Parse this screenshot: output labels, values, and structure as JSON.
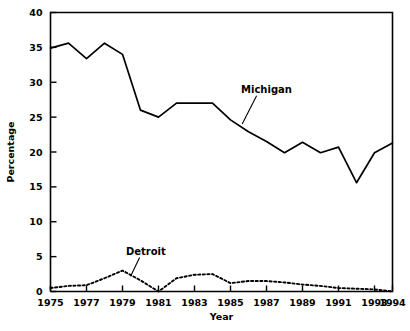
{
  "chart_data": {
    "type": "line",
    "title": "",
    "xlabel": "Year",
    "ylabel": "Percentage",
    "xlim": [
      1975,
      1994
    ],
    "ylim": [
      0,
      40
    ],
    "ytick_labels": [
      "0",
      "5",
      "10",
      "15",
      "20",
      "25",
      "30",
      "35",
      "40"
    ],
    "yticks": [
      0,
      5,
      10,
      15,
      20,
      25,
      30,
      35,
      40
    ],
    "xtick_labels": [
      "1975",
      "1977",
      "1979",
      "1981",
      "1983",
      "1985",
      "1987",
      "1989",
      "1991",
      "1993",
      "1994"
    ],
    "xticks": [
      1975,
      1977,
      1979,
      1981,
      1983,
      1985,
      1987,
      1989,
      1991,
      1993,
      1994
    ],
    "grid": false,
    "legend_position": "inline-annotations",
    "x": [
      1975,
      1976,
      1977,
      1978,
      1979,
      1980,
      1981,
      1982,
      1983,
      1984,
      1985,
      1986,
      1987,
      1988,
      1989,
      1990,
      1991,
      1992,
      1993,
      1994
    ],
    "series": [
      {
        "name": "Michigan",
        "style": "solid",
        "values": [
          34.9,
          35.6,
          33.4,
          35.6,
          34.0,
          26.0,
          25.0,
          27.0,
          27.0,
          27.0,
          24.6,
          22.9,
          21.5,
          19.9,
          21.4,
          19.9,
          20.7,
          15.6,
          19.9,
          21.3
        ]
      },
      {
        "name": "Detroit",
        "style": "dotted",
        "values": [
          0.5,
          0.8,
          0.9,
          1.9,
          3.0,
          1.6,
          0.0,
          1.9,
          2.4,
          2.5,
          1.2,
          1.5,
          1.5,
          1.3,
          1.0,
          0.8,
          0.5,
          0.4,
          0.3,
          0.0
        ]
      }
    ],
    "annotations": [
      {
        "text": "Michigan",
        "x": 1987.0,
        "y": 28.5
      },
      {
        "text": "Detroit",
        "x": 1980.3,
        "y": 5.3
      }
    ]
  }
}
